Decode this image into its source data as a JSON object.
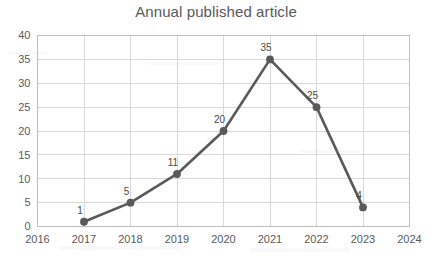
{
  "chart_data": {
    "type": "line",
    "title": "Annual published article",
    "xlabel": "",
    "ylabel": "",
    "x": [
      2016,
      2017,
      2018,
      2019,
      2020,
      2021,
      2022,
      2023,
      2024
    ],
    "xtick_labels": [
      "2016",
      "2017",
      "2018",
      "2019",
      "2020",
      "2021",
      "2022",
      "2023",
      "2024"
    ],
    "xlim": [
      2016,
      2024
    ],
    "ylim": [
      0,
      40
    ],
    "ytick_labels": [
      "0",
      "5",
      "10",
      "15",
      "20",
      "25",
      "30",
      "35",
      "40"
    ],
    "yticks": [
      0,
      5,
      10,
      15,
      20,
      25,
      30,
      35,
      40
    ],
    "grid": true,
    "legend": false,
    "series": [
      {
        "name": "Annual published article",
        "color": "#595959",
        "marker": "circle",
        "x": [
          2017,
          2018,
          2019,
          2020,
          2021,
          2022,
          2023
        ],
        "values": [
          1,
          5,
          11,
          20,
          35,
          25,
          4
        ],
        "data_labels": [
          "1",
          "5",
          "11",
          "20",
          "35",
          "25",
          "4"
        ]
      }
    ]
  },
  "style": {
    "line_color": "#595959",
    "grid_color": "#d9d9d9",
    "border_color": "#bfbfbf",
    "text_color": "#5a5a5a",
    "title_color": "#595959",
    "background": "#ffffff"
  }
}
